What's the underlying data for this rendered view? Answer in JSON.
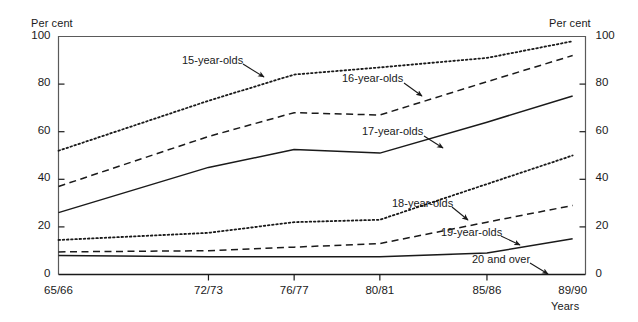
{
  "chart_data": {
    "type": "line",
    "title": "",
    "xlabel": "Years",
    "ylabel": "Per cent",
    "ylabel_right": "Per cent",
    "categories": [
      "65/66",
      "72/73",
      "76/77",
      "80/81",
      "85/86",
      "89/90"
    ],
    "x_positions": [
      0,
      7,
      11,
      15,
      20,
      24
    ],
    "xlim": [
      0,
      24.6
    ],
    "ylim": [
      0,
      100
    ],
    "yticks": [
      0,
      20,
      40,
      60,
      80,
      100
    ],
    "yticks_right": [
      0,
      20,
      40,
      60,
      80,
      100
    ],
    "grid": false,
    "legend": "inline-annotations",
    "series": [
      {
        "name": "15-year-olds",
        "style": "dotted",
        "values": [
          52,
          73,
          84,
          87,
          91,
          98
        ],
        "label_x": 182,
        "label_y": 54,
        "arrow": {
          "x1": 243,
          "y1": 64,
          "x2": 264,
          "y2": 77
        }
      },
      {
        "name": "16-year-olds",
        "style": "dashed",
        "values": [
          37,
          58,
          68,
          67,
          81,
          92
        ],
        "label_x": 342,
        "label_y": 72,
        "arrow": {
          "x1": 404,
          "y1": 83,
          "x2": 422,
          "y2": 96
        }
      },
      {
        "name": "17-year-olds",
        "style": "solid",
        "values": [
          26,
          45,
          52.5,
          51,
          64,
          75
        ],
        "label_x": 362,
        "label_y": 125,
        "arrow": {
          "x1": 424,
          "y1": 136,
          "x2": 443,
          "y2": 148
        }
      },
      {
        "name": "18-year-olds",
        "style": "dotted",
        "values": [
          14.5,
          17.5,
          22,
          23,
          38,
          50
        ],
        "label_x": 392,
        "label_y": 197,
        "arrow": {
          "x1": 452,
          "y1": 207,
          "x2": 468,
          "y2": 220
        }
      },
      {
        "name": "19-year-olds",
        "style": "dashed",
        "values": [
          9.5,
          10,
          11.5,
          13,
          22,
          29
        ],
        "label_x": 441,
        "label_y": 226,
        "arrow": {
          "x1": 501,
          "y1": 236,
          "x2": 520,
          "y2": 245
        }
      },
      {
        "name": "20 and over",
        "style": "solid",
        "values": [
          8,
          7.5,
          7.5,
          7.5,
          9,
          15
        ],
        "label_x": 472,
        "label_y": 253,
        "arrow": {
          "x1": 530,
          "y1": 263,
          "x2": 548,
          "y2": 274
        }
      }
    ]
  },
  "colors": {
    "ink": "#1a1a1a",
    "axis": "#5a5a5a",
    "background": "#ffffff"
  }
}
